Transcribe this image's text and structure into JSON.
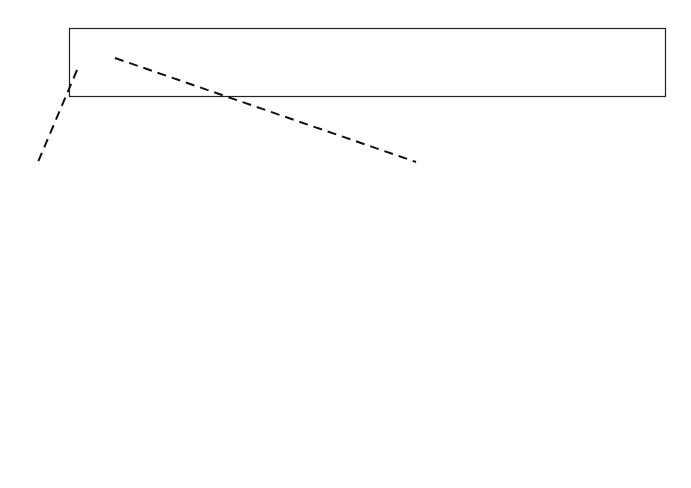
{
  "ruler": {
    "unit_label": "cm",
    "min": 0,
    "max": 15,
    "labels": [
      "0",
      "1",
      "2",
      "3",
      "4",
      "5",
      "6",
      "7",
      "8",
      "9",
      "10",
      "11",
      "12",
      "13",
      "14",
      "15"
    ],
    "minor_divisions_per_unit": 10,
    "colors": {
      "stroke": "#222222",
      "background": "#ffffff"
    }
  },
  "magnified": {
    "range_start_label": "0",
    "range_end_label": "1",
    "divisions": 10,
    "description": "Enlarged view of the ruler segment from 0 to 1 cm showing millimeter ticks",
    "colors": {
      "stroke": "#111111"
    }
  },
  "connector": {
    "style": "dashed"
  }
}
